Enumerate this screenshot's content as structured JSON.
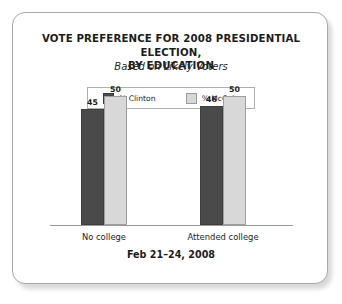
{
  "card": {
    "border_color": "#a9a9a9",
    "background": "#ffffff"
  },
  "title_line_1": "VOTE PREFERENCE FOR 2008 PRESIDENTIAL ELECTION,",
  "title_line_2": "BY EDUCATION",
  "subtitle": "Based on Likely Voters",
  "legend": {
    "items": [
      {
        "label": "% Clinton",
        "color": "#4a4a4a",
        "swatch_name": "clinton-swatch"
      },
      {
        "label": "% McCain",
        "color": "#d8d8d8",
        "swatch_name": "mccain-swatch"
      }
    ]
  },
  "footer": "Feb 21–24, 2008",
  "chart_data": {
    "type": "bar",
    "title": "VOTE PREFERENCE FOR 2008 PRESIDENTIAL ELECTION, BY EDUCATION",
    "subtitle": "Based on Likely Voters",
    "note": "Feb 21–24, 2008",
    "categories": [
      "No college",
      "Attended college"
    ],
    "series": [
      {
        "name": "% Clinton",
        "color": "#4a4a4a",
        "values": [
          45,
          50
        ]
      },
      {
        "name": "% McCain",
        "color": "#d8d8d8",
        "values": [
          46,
          50
        ]
      }
    ],
    "groups": [
      {
        "category": "No college",
        "bars": [
          {
            "series": "% Clinton",
            "value": 45,
            "label": "45",
            "color": "#4a4a4a"
          },
          {
            "series": "% McCain",
            "value": 50,
            "label": "50",
            "color": "#d8d8d8"
          }
        ]
      },
      {
        "category": "Attended college",
        "bars": [
          {
            "series": "% Clinton",
            "value": 46,
            "label": "46",
            "color": "#4a4a4a"
          },
          {
            "series": "% McCain",
            "value": 50,
            "label": "50",
            "color": "#d8d8d8"
          }
        ]
      }
    ],
    "xlabel": "",
    "ylabel": "",
    "ylim": [
      0,
      58
    ],
    "grid": false,
    "legend_position": "top-center",
    "axis_line": true
  }
}
